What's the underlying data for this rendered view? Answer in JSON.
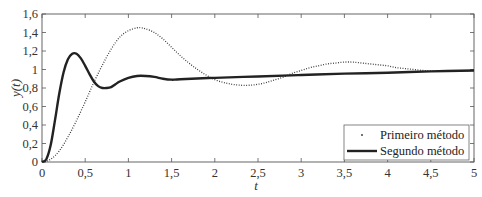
{
  "chart_data": {
    "type": "line",
    "title": "",
    "xlabel": "t",
    "ylabel": "y(t)",
    "xlim": [
      0,
      5
    ],
    "ylim": [
      0,
      1.6
    ],
    "grid": false,
    "legend_position": "lower right",
    "xticks": [
      0,
      0.5,
      1,
      1.5,
      2,
      2.5,
      3,
      3.5,
      4,
      4.5,
      5
    ],
    "xtick_labels": [
      "0",
      "0,5",
      "1",
      "1,5",
      "2",
      "2,5",
      "3",
      "3,5",
      "4",
      "4,5",
      "5"
    ],
    "yticks": [
      0,
      0.2,
      0.4,
      0.6,
      0.8,
      1,
      1.2,
      1.4,
      1.6
    ],
    "ytick_labels": [
      "0",
      "0,2",
      "0,4",
      "0,6",
      "0,8",
      "1",
      "1,2",
      "1,4",
      "1,6"
    ],
    "series": [
      {
        "name": "Primeiro método",
        "style": "dotted",
        "color": "#333333",
        "x": [
          0,
          0.1,
          0.2,
          0.3,
          0.4,
          0.5,
          0.6,
          0.7,
          0.8,
          0.9,
          1.0,
          1.1,
          1.15,
          1.2,
          1.3,
          1.4,
          1.5,
          1.6,
          1.7,
          1.8,
          1.9,
          2.0,
          2.1,
          2.2,
          2.3,
          2.4,
          2.5,
          2.6,
          2.7,
          2.8,
          2.9,
          3.0,
          3.1,
          3.2,
          3.3,
          3.4,
          3.5,
          3.6,
          3.7,
          3.8,
          3.9,
          4.0,
          4.1,
          4.2,
          4.3,
          4.4,
          4.5,
          4.6,
          4.7,
          4.8,
          4.9,
          5.0
        ],
        "values": [
          0,
          0.03,
          0.12,
          0.27,
          0.45,
          0.65,
          0.86,
          1.05,
          1.22,
          1.35,
          1.42,
          1.45,
          1.45,
          1.44,
          1.4,
          1.33,
          1.24,
          1.15,
          1.07,
          1.0,
          0.94,
          0.89,
          0.86,
          0.84,
          0.83,
          0.83,
          0.84,
          0.86,
          0.89,
          0.92,
          0.96,
          0.99,
          1.02,
          1.04,
          1.06,
          1.07,
          1.08,
          1.08,
          1.07,
          1.06,
          1.05,
          1.04,
          1.02,
          1.01,
          1.0,
          0.99,
          0.985,
          0.98,
          0.98,
          0.98,
          0.985,
          0.99
        ]
      },
      {
        "name": "Segundo método",
        "style": "solid",
        "color": "#222222",
        "x": [
          0,
          0.05,
          0.1,
          0.15,
          0.2,
          0.25,
          0.3,
          0.35,
          0.4,
          0.45,
          0.5,
          0.55,
          0.6,
          0.65,
          0.7,
          0.75,
          0.8,
          0.85,
          0.9,
          1.0,
          1.1,
          1.2,
          1.3,
          1.4,
          1.5,
          1.6,
          2.0,
          2.5,
          3.0,
          3.5,
          4.0,
          4.5,
          5.0
        ],
        "values": [
          0,
          0.03,
          0.18,
          0.45,
          0.74,
          0.97,
          1.11,
          1.17,
          1.17,
          1.12,
          1.04,
          0.95,
          0.87,
          0.82,
          0.8,
          0.8,
          0.81,
          0.84,
          0.87,
          0.91,
          0.93,
          0.93,
          0.92,
          0.9,
          0.89,
          0.895,
          0.91,
          0.925,
          0.94,
          0.955,
          0.965,
          0.98,
          0.99
        ]
      }
    ]
  },
  "legend": {
    "items": [
      {
        "label": "Primeiro método",
        "marker": "dot"
      },
      {
        "label": "Segundo método",
        "marker": "line"
      }
    ]
  },
  "axes": {
    "x_title": "t",
    "y_title": "y(t)"
  },
  "colors": {
    "axis": "#555555",
    "line_primary": "#222222",
    "line_dotted": "#333333"
  }
}
